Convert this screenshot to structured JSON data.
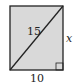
{
  "figure": {
    "shape": "rectangle",
    "fill_color": "#d9d9d9",
    "stroke_color": "#222222",
    "labels": {
      "diagonal": "15",
      "right_side": "x",
      "bottom_side": "10"
    },
    "right_angle_marker": "bottom-right"
  }
}
